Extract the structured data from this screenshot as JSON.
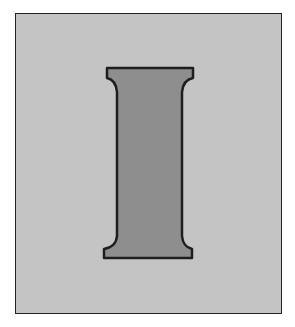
{
  "figure": {
    "letter": "I",
    "colors": {
      "background": "#ffffff",
      "panel": "#c4c4c4",
      "letter_fill": "#8e8e8e",
      "outline": "#1e1e1e"
    }
  }
}
